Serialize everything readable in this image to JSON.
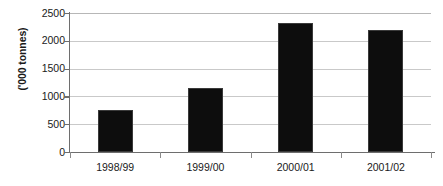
{
  "chart_data": {
    "type": "bar",
    "title": "",
    "xlabel": "",
    "ylabel": "('000 tonnes)",
    "categories": [
      "1998/99",
      "1999/00",
      "2000/01",
      "2001/02"
    ],
    "values": [
      755,
      1150,
      2320,
      2195
    ],
    "ylim": [
      0,
      2500
    ],
    "yticks": [
      0,
      500,
      1000,
      1500,
      2000,
      2500
    ],
    "ytick_labels": [
      "0",
      "500",
      "1000",
      "1500",
      "2000",
      "2500"
    ],
    "grid": true,
    "legend": null,
    "series": [
      {
        "name": "('000 tonnes)",
        "values": [
          755,
          1150,
          2320,
          2195
        ]
      }
    ],
    "colors": {
      "bar": "#0d0d0d",
      "gridline": "#c9c9c9",
      "axis": "#6e6e6e",
      "text": "#1a1a1a",
      "background": "#ffffff"
    }
  }
}
